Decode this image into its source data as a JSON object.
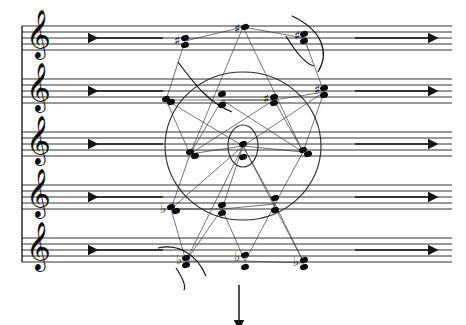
{
  "page": {
    "width": 466,
    "height": 325,
    "background": "#ffffff",
    "ink_color": "#0d0d0d",
    "lattice_color": "#3a3a3a",
    "circle_color": "#2a2a2a"
  },
  "score": {
    "system_count": 1,
    "staff_count": 5,
    "staff_line_count": 5,
    "staff_line_spacing_px": 6,
    "staff_top_y": [
      26,
      79,
      132,
      185,
      238
    ],
    "staff_left_x": 22,
    "staff_right_x": 452,
    "clef_name": "treble-clef",
    "clef_glyph": "𝄞",
    "brace_label": "system-bracket"
  },
  "duration_lines": [
    {
      "staff": 1,
      "label": "duration-line-arrow-left",
      "direction": "left",
      "x_start": 88,
      "x_end": 163,
      "y": 38
    },
    {
      "staff": 2,
      "label": "duration-line-arrow-left",
      "direction": "left",
      "x_start": 88,
      "x_end": 163,
      "y": 91
    },
    {
      "staff": 3,
      "label": "duration-line-arrow-left",
      "direction": "left",
      "x_start": 88,
      "x_end": 163,
      "y": 144
    },
    {
      "staff": 4,
      "label": "duration-line-arrow-left",
      "direction": "left",
      "x_start": 88,
      "x_end": 163,
      "y": 197
    },
    {
      "staff": 5,
      "label": "duration-line-arrow-left",
      "direction": "left",
      "x_start": 88,
      "x_end": 163,
      "y": 250
    },
    {
      "staff": 1,
      "label": "duration-line-arrow-right",
      "direction": "right",
      "x_start": 355,
      "x_end": 428,
      "y": 38
    },
    {
      "staff": 2,
      "label": "duration-line-arrow-right",
      "direction": "right",
      "x_start": 355,
      "x_end": 428,
      "y": 91
    },
    {
      "staff": 3,
      "label": "duration-line-arrow-right",
      "direction": "right",
      "x_start": 355,
      "x_end": 428,
      "y": 144
    },
    {
      "staff": 4,
      "label": "duration-line-arrow-right",
      "direction": "right",
      "x_start": 355,
      "x_end": 428,
      "y": 197
    },
    {
      "staff": 5,
      "label": "duration-line-arrow-right",
      "direction": "right",
      "x_start": 355,
      "x_end": 428,
      "y": 250
    }
  ],
  "tempo_arrow": {
    "label": "downward-direction-arrow",
    "x": 239,
    "y_start": 285,
    "y_end": 320
  },
  "note_groups": [
    {
      "name": "chord-s1-a",
      "staff": 1,
      "x": 184,
      "accidental": "sharp",
      "accidental_x": 174,
      "accidental_y": 41,
      "noteheads": [
        {
          "x": 185,
          "y": 38
        },
        {
          "x": 185,
          "y": 45
        }
      ]
    },
    {
      "name": "chord-s1-b",
      "staff": 1,
      "x": 243,
      "accidental": "sharp",
      "accidental_x": 234,
      "accidental_y": 29,
      "noteheads": [
        {
          "x": 245,
          "y": 27
        }
      ]
    },
    {
      "name": "chord-s1-c",
      "staff": 1,
      "x": 302,
      "accidental": "sharp",
      "accidental_x": 294,
      "accidental_y": 36,
      "noteheads": [
        {
          "x": 304,
          "y": 34
        },
        {
          "x": 304,
          "y": 41
        }
      ]
    },
    {
      "name": "chord-s2-a",
      "staff": 2,
      "x": 166,
      "accidental": "none",
      "accidental_x": 0,
      "accidental_y": 0,
      "noteheads": [
        {
          "x": 166,
          "y": 99
        },
        {
          "x": 171,
          "y": 102
        }
      ]
    },
    {
      "name": "chord-s2-b",
      "staff": 2,
      "x": 222,
      "accidental": "none",
      "accidental_x": 0,
      "accidental_y": 0,
      "noteheads": [
        {
          "x": 222,
          "y": 94
        },
        {
          "x": 222,
          "y": 105
        }
      ]
    },
    {
      "name": "chord-s2-c",
      "staff": 2,
      "x": 272,
      "accidental": "sharp",
      "accidental_x": 263,
      "accidental_y": 99,
      "noteheads": [
        {
          "x": 274,
          "y": 97
        },
        {
          "x": 274,
          "y": 103
        }
      ]
    },
    {
      "name": "chord-s2-d",
      "staff": 2,
      "x": 322,
      "accidental": "sharp",
      "accidental_x": 314,
      "accidental_y": 90,
      "noteheads": [
        {
          "x": 324,
          "y": 88
        },
        {
          "x": 324,
          "y": 95
        }
      ]
    },
    {
      "name": "chord-s3-a",
      "staff": 3,
      "x": 190,
      "accidental": "none",
      "accidental_x": 0,
      "accidental_y": 0,
      "noteheads": [
        {
          "x": 190,
          "y": 152
        },
        {
          "x": 195,
          "y": 156
        }
      ]
    },
    {
      "name": "chord-s3-b",
      "staff": 3,
      "x": 243,
      "accidental": "none",
      "accidental_x": 0,
      "accidental_y": 0,
      "noteheads": [
        {
          "x": 243,
          "y": 144
        },
        {
          "x": 243,
          "y": 157
        }
      ]
    },
    {
      "name": "chord-s3-c",
      "staff": 3,
      "x": 303,
      "accidental": "none",
      "accidental_x": 0,
      "accidental_y": 0,
      "noteheads": [
        {
          "x": 303,
          "y": 150
        },
        {
          "x": 308,
          "y": 154
        }
      ]
    },
    {
      "name": "chord-s4-a",
      "staff": 4,
      "x": 170,
      "accidental": "flat",
      "accidental_x": 160,
      "accidental_y": 209,
      "noteheads": [
        {
          "x": 171,
          "y": 207
        },
        {
          "x": 176,
          "y": 211
        }
      ]
    },
    {
      "name": "chord-s4-b",
      "staff": 4,
      "x": 222,
      "accidental": "none",
      "accidental_x": 0,
      "accidental_y": 0,
      "noteheads": [
        {
          "x": 222,
          "y": 205
        },
        {
          "x": 222,
          "y": 213
        }
      ]
    },
    {
      "name": "chord-s4-c",
      "staff": 4,
      "x": 275,
      "accidental": "none",
      "accidental_x": 0,
      "accidental_y": 0,
      "noteheads": [
        {
          "x": 275,
          "y": 198
        },
        {
          "x": 275,
          "y": 210
        }
      ]
    },
    {
      "name": "chord-s5-a",
      "staff": 5,
      "x": 185,
      "accidental": "flat",
      "accidental_x": 176,
      "accidental_y": 260,
      "noteheads": [
        {
          "x": 186,
          "y": 258
        },
        {
          "x": 186,
          "y": 265
        }
      ]
    },
    {
      "name": "chord-s5-b",
      "staff": 5,
      "x": 243,
      "accidental": "flat",
      "accidental_x": 234,
      "accidental_y": 257,
      "noteheads": [
        {
          "x": 245,
          "y": 255
        },
        {
          "x": 245,
          "y": 267
        }
      ]
    },
    {
      "name": "chord-s5-c",
      "staff": 5,
      "x": 303,
      "accidental": "flat",
      "accidental_x": 293,
      "accidental_y": 262,
      "noteheads": [
        {
          "x": 304,
          "y": 260
        },
        {
          "x": 304,
          "y": 267
        }
      ]
    }
  ],
  "geometry": {
    "outer_circle": {
      "name": "outer-circle",
      "cx": 243,
      "cy": 146,
      "rx": 78,
      "ry": 74
    },
    "inner_circle": {
      "name": "inner-circle",
      "cx": 243,
      "cy": 146,
      "rx": 15,
      "ry": 21
    },
    "lattice_name": "lattice-network",
    "lattice_edges": [
      [
        185,
        41,
        243,
        27
      ],
      [
        243,
        27,
        304,
        38
      ],
      [
        185,
        41,
        166,
        100
      ],
      [
        304,
        38,
        324,
        92
      ],
      [
        166,
        100,
        222,
        100
      ],
      [
        222,
        100,
        274,
        100
      ],
      [
        274,
        100,
        324,
        92
      ],
      [
        166,
        100,
        190,
        154
      ],
      [
        222,
        100,
        190,
        154
      ],
      [
        222,
        100,
        274,
        100
      ],
      [
        274,
        100,
        303,
        152
      ],
      [
        324,
        92,
        303,
        152
      ],
      [
        190,
        154,
        243,
        146
      ],
      [
        243,
        146,
        303,
        152
      ],
      [
        190,
        154,
        171,
        209
      ],
      [
        243,
        146,
        222,
        209
      ],
      [
        303,
        152,
        275,
        204
      ],
      [
        171,
        209,
        222,
        209
      ],
      [
        222,
        209,
        275,
        204
      ],
      [
        171,
        209,
        186,
        261
      ],
      [
        222,
        209,
        186,
        261
      ],
      [
        222,
        209,
        245,
        261
      ],
      [
        275,
        204,
        245,
        261
      ],
      [
        275,
        204,
        304,
        263
      ],
      [
        186,
        261,
        245,
        261
      ],
      [
        245,
        261,
        304,
        263
      ],
      [
        166,
        100,
        243,
        146
      ],
      [
        324,
        92,
        243,
        146
      ],
      [
        243,
        27,
        190,
        154
      ],
      [
        243,
        27,
        303,
        152
      ],
      [
        186,
        261,
        243,
        146
      ],
      [
        304,
        263,
        243,
        146
      ],
      [
        190,
        154,
        274,
        100
      ],
      [
        303,
        152,
        222,
        100
      ],
      [
        171,
        209,
        243,
        146
      ],
      [
        275,
        204,
        243,
        146
      ]
    ],
    "slurs": [
      {
        "name": "slur-top-right",
        "d": "M 292 16 C 322 30 330 52 318 72"
      },
      {
        "name": "slur-staff1-lower",
        "d": "M 286 36 C 298 56 306 64 314 66"
      },
      {
        "name": "slur-staff2-left",
        "d": "M 178 62 C 196 86 208 102 232 112"
      },
      {
        "name": "slur-staff5-left",
        "d": "M 158 248 C 176 244 196 252 206 276"
      },
      {
        "name": "slur-staff5-hook",
        "d": "M 176 268 C 184 280 186 286 184 290"
      }
    ]
  },
  "legend": {
    "notation_note": "Aleatoric circular notation with proportional duration arrows"
  }
}
